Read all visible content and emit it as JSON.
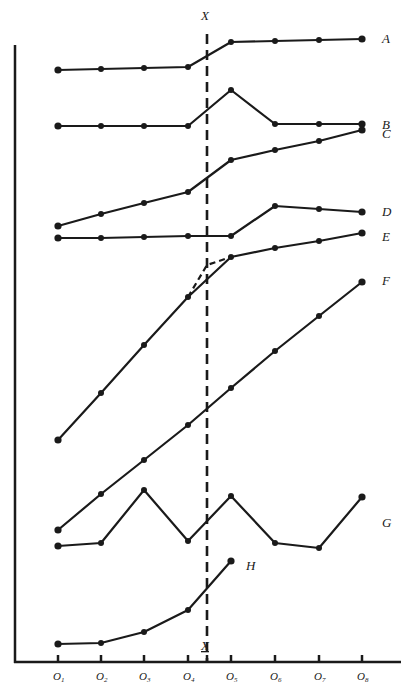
{
  "chart_data": {
    "type": "line",
    "title": "",
    "xlabel": "",
    "ylabel": "",
    "categories": [
      "O1",
      "O2",
      "O3",
      "O4",
      "O5",
      "O6",
      "O7",
      "O8"
    ],
    "intervention": {
      "label": "X",
      "position_between": [
        "O4",
        "O5"
      ],
      "style": "dashed vertical line",
      "bottom_label": "X"
    },
    "grid": false,
    "legend": "series labels at right end of each line",
    "y_axis_ticks": false,
    "note": "Values are relative heights (0 = baseline, higher = larger); no numeric y-axis shown.",
    "series": [
      {
        "name": "A",
        "values": [
          59,
          60,
          61,
          62,
          87,
          88,
          89,
          90
        ]
      },
      {
        "name": "B",
        "values": [
          50,
          50,
          50,
          50,
          65,
          50,
          50,
          50
        ]
      },
      {
        "name": "C",
        "values": [
          11,
          18,
          24,
          30,
          49,
          55,
          60,
          67
        ]
      },
      {
        "name": "D",
        "values": [
          4,
          4,
          5,
          5,
          5,
          22,
          20,
          18
        ]
      },
      {
        "name": "E",
        "values": [
          -56,
          -40,
          -24,
          -8,
          5,
          8,
          10,
          13
        ],
        "dashed_projection": "from O4 extended to X then to O5"
      },
      {
        "name": "F",
        "values": [
          -70,
          -58,
          -46,
          -34,
          -22,
          -10,
          2,
          13
        ]
      },
      {
        "name": "G",
        "values": [
          -78,
          -77,
          -59,
          -76,
          -61,
          -77,
          -79,
          -61
        ]
      },
      {
        "name": "H",
        "values": [
          -111,
          -110,
          -107,
          -99,
          -83,
          null,
          null,
          null
        ]
      }
    ]
  },
  "labels": {
    "x_top": "X",
    "x_bottom": "X",
    "ticks": [
      {
        "main": "O",
        "sub": "1"
      },
      {
        "main": "O",
        "sub": "2"
      },
      {
        "main": "O",
        "sub": "3"
      },
      {
        "main": "O",
        "sub": "4"
      },
      {
        "main": "O",
        "sub": "5"
      },
      {
        "main": "O",
        "sub": "6"
      },
      {
        "main": "O",
        "sub": "7"
      },
      {
        "main": "O",
        "sub": "8"
      }
    ],
    "series": [
      "A",
      "B",
      "C",
      "D",
      "E",
      "F",
      "G",
      "H"
    ]
  },
  "pixels": {
    "x": [
      58,
      101,
      144,
      188,
      231,
      275,
      319,
      362
    ],
    "xline": 207,
    "series": {
      "A": [
        70,
        69,
        68,
        67,
        42,
        41,
        40,
        39
      ],
      "B": [
        126,
        126,
        126,
        126,
        90,
        124,
        124,
        124
      ],
      "C": [
        226,
        214,
        203,
        192,
        160,
        150,
        141,
        130
      ],
      "D": [
        238,
        238,
        237,
        236,
        236,
        206,
        209,
        212
      ],
      "E": [
        440,
        393,
        345,
        297,
        257,
        248,
        241,
        233
      ],
      "F": [
        530,
        494,
        460,
        425,
        388,
        351,
        316,
        282
      ],
      "G": [
        546,
        543,
        490,
        541,
        496,
        543,
        548,
        497
      ],
      "H": [
        644,
        643,
        632,
        610,
        561
      ]
    },
    "label_pos": {
      "A": [
        382,
        43
      ],
      "B": [
        382,
        129
      ],
      "C": [
        382,
        138
      ],
      "D": [
        382,
        216
      ],
      "E": [
        382,
        241
      ],
      "F": [
        382,
        285
      ],
      "G": [
        382,
        527
      ],
      "H": [
        246,
        570
      ]
    }
  }
}
